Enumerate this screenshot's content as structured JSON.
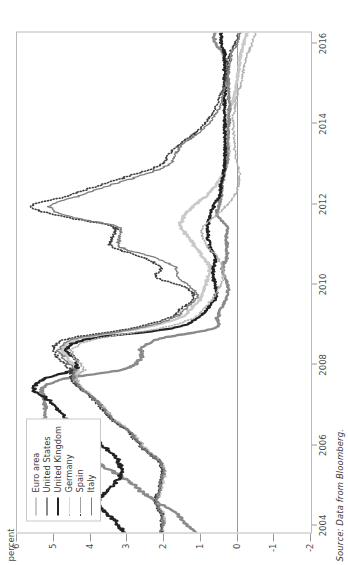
{
  "figure": {
    "ylabel": "percent",
    "source": "Source: Data from Bloomberg."
  },
  "chart_data": {
    "type": "line",
    "title": "",
    "xlabel": "",
    "ylabel": "percent",
    "orientation": "rotated-90-ccw",
    "grid": false,
    "zero_line": true,
    "legend_position": "top-left-inside",
    "xlim": [
      2003.8,
      2016.25
    ],
    "ylim": [
      -2,
      6
    ],
    "yticks": [
      "6",
      "5",
      "4",
      "3",
      "2",
      "1",
      "0",
      "-1",
      "-2"
    ],
    "ytick_values": [
      6,
      5,
      4,
      3,
      2,
      1,
      0,
      -1,
      -2
    ],
    "xticks": [
      "2004",
      "2006",
      "2008",
      "2010",
      "2012",
      "2014",
      "2016"
    ],
    "xtick_values": [
      2004,
      2006,
      2008,
      2010,
      2012,
      2014,
      2016
    ],
    "x": [
      2004.0,
      2004.25,
      2004.5,
      2004.75,
      2005.0,
      2005.25,
      2005.5,
      2005.75,
      2006.0,
      2006.25,
      2006.5,
      2006.75,
      2007.0,
      2007.25,
      2007.5,
      2007.75,
      2008.0,
      2008.25,
      2008.5,
      2008.75,
      2009.0,
      2009.25,
      2009.5,
      2009.75,
      2010.0,
      2010.25,
      2010.5,
      2010.75,
      2011.0,
      2011.25,
      2011.5,
      2011.75,
      2012.0,
      2012.25,
      2012.5,
      2012.75,
      2013.0,
      2013.25,
      2013.5,
      2013.75,
      2014.0,
      2014.25,
      2014.5,
      2014.75,
      2015.0,
      2015.25,
      2015.5,
      2015.75,
      2016.0,
      2016.2
    ],
    "series": [
      {
        "name": "Euro area",
        "color": "#c9c9c9",
        "style": "solid",
        "width": 2.4,
        "values": [
          2.05,
          2.0,
          2.05,
          2.2,
          2.1,
          2.05,
          2.0,
          2.1,
          2.45,
          2.7,
          2.95,
          3.35,
          3.6,
          3.85,
          4.2,
          4.4,
          4.35,
          4.6,
          4.75,
          4.3,
          2.65,
          1.6,
          1.25,
          1.0,
          0.9,
          0.8,
          0.75,
          0.95,
          1.15,
          1.35,
          1.55,
          1.45,
          1.2,
          0.85,
          0.6,
          0.4,
          0.3,
          0.25,
          0.25,
          0.3,
          0.3,
          0.25,
          0.15,
          0.08,
          0.02,
          -0.02,
          -0.05,
          -0.1,
          -0.18,
          -0.25
        ]
      },
      {
        "name": "United States",
        "color": "#8a8a8a",
        "style": "solid",
        "width": 2.4,
        "values": [
          1.15,
          1.45,
          1.7,
          2.2,
          2.6,
          2.95,
          3.4,
          3.95,
          4.55,
          5.05,
          5.3,
          5.25,
          5.25,
          5.25,
          5.3,
          4.8,
          3.1,
          2.65,
          2.6,
          2.1,
          0.65,
          0.55,
          0.45,
          0.3,
          0.25,
          0.35,
          0.4,
          0.3,
          0.3,
          0.3,
          0.28,
          0.55,
          0.5,
          0.45,
          0.42,
          0.38,
          0.3,
          0.28,
          0.27,
          0.25,
          0.24,
          0.23,
          0.23,
          0.24,
          0.25,
          0.28,
          0.3,
          0.4,
          0.6,
          0.62
        ]
      },
      {
        "name": "United Kingdom",
        "color": "#222222",
        "style": "solid",
        "width": 2.2,
        "values": [
          3.1,
          3.3,
          3.6,
          3.8,
          3.55,
          3.3,
          3.15,
          3.25,
          3.5,
          3.85,
          4.2,
          4.6,
          4.9,
          5.15,
          5.55,
          5.3,
          4.45,
          4.4,
          4.65,
          4.0,
          1.8,
          1.1,
          0.8,
          0.6,
          0.6,
          0.65,
          0.65,
          0.6,
          0.75,
          0.8,
          0.8,
          0.75,
          0.65,
          0.5,
          0.45,
          0.4,
          0.35,
          0.35,
          0.35,
          0.35,
          0.35,
          0.35,
          0.35,
          0.35,
          0.35,
          0.35,
          0.35,
          0.35,
          0.45,
          0.45
        ]
      },
      {
        "name": "Germany",
        "color": "#b0b0b0",
        "style": "dotted",
        "width": 1.6,
        "values": [
          2.05,
          2.0,
          2.05,
          2.2,
          2.1,
          2.05,
          2.0,
          2.1,
          2.45,
          2.7,
          2.95,
          3.35,
          3.6,
          3.85,
          4.2,
          4.4,
          4.2,
          4.4,
          4.5,
          3.8,
          2.1,
          1.2,
          0.9,
          0.65,
          0.5,
          0.4,
          0.4,
          0.55,
          0.8,
          0.95,
          0.9,
          0.6,
          0.3,
          0.1,
          -0.02,
          -0.05,
          0.0,
          0.05,
          0.08,
          0.1,
          0.12,
          0.1,
          0.05,
          0.0,
          -0.1,
          -0.15,
          -0.2,
          -0.28,
          -0.4,
          -0.48
        ]
      },
      {
        "name": "Spain",
        "color": "#3f3f3f",
        "style": "dotted",
        "width": 1.6,
        "values": [
          2.1,
          2.05,
          2.1,
          2.25,
          2.15,
          2.1,
          2.05,
          2.15,
          2.5,
          2.75,
          3.0,
          3.4,
          3.65,
          3.9,
          4.25,
          4.5,
          4.55,
          4.85,
          5.0,
          4.6,
          2.9,
          1.9,
          1.5,
          1.2,
          1.4,
          2.2,
          2.1,
          2.6,
          3.4,
          3.4,
          3.4,
          4.8,
          5.6,
          4.6,
          3.8,
          2.9,
          2.1,
          1.9,
          1.6,
          1.2,
          0.9,
          0.7,
          0.55,
          0.45,
          0.35,
          0.3,
          0.25,
          0.2,
          0.05,
          -0.05
        ]
      },
      {
        "name": "Italy",
        "color": "#7d7d7d",
        "style": "solid",
        "width": 1.3,
        "values": [
          2.08,
          2.02,
          2.08,
          2.22,
          2.12,
          2.08,
          2.02,
          2.12,
          2.48,
          2.72,
          2.98,
          3.38,
          3.62,
          3.88,
          4.22,
          4.45,
          4.45,
          4.7,
          4.85,
          4.4,
          2.75,
          1.75,
          1.4,
          1.1,
          1.25,
          1.6,
          1.7,
          2.3,
          3.2,
          3.2,
          3.3,
          4.6,
          5.1,
          4.3,
          3.5,
          2.6,
          1.9,
          1.7,
          1.5,
          1.1,
          0.8,
          0.6,
          0.45,
          0.4,
          0.3,
          0.25,
          0.2,
          0.15,
          0.0,
          -0.08
        ]
      }
    ]
  },
  "legend": {
    "items": [
      {
        "label": "Euro area"
      },
      {
        "label": "United States"
      },
      {
        "label": "United Kingdom"
      },
      {
        "label": "Germany"
      },
      {
        "label": "Spain"
      },
      {
        "label": "Italy"
      }
    ]
  }
}
